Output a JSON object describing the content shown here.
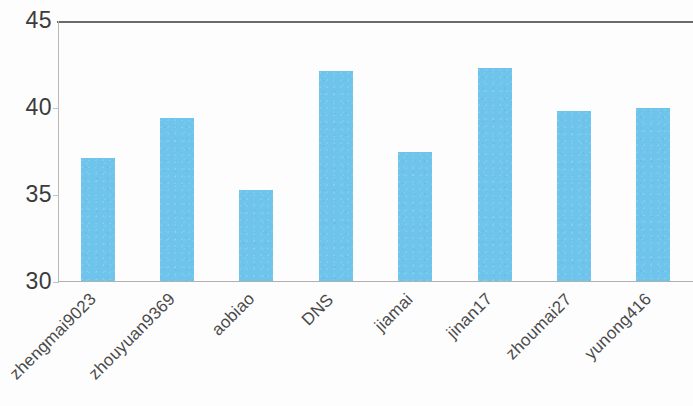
{
  "chart_data": {
    "type": "bar",
    "title": "",
    "subtitle": "",
    "xlabel": "",
    "ylabel": "",
    "categories": [
      "zhengmai9023",
      "zhouyuan9369",
      "aobiao",
      "DNS",
      "jiamai",
      "jinan17",
      "zhoumai27",
      "yunong416"
    ],
    "values": [
      37.1,
      39.4,
      35.3,
      42.1,
      37.5,
      42.3,
      39.8,
      40.0
    ],
    "ylim": [
      30,
      45
    ],
    "yticks": [
      30,
      35,
      40,
      45
    ],
    "ytick_labels": [
      "30",
      "35",
      "40",
      "45"
    ],
    "grid": false,
    "legend": false,
    "legend_position": "none",
    "bar_color": "#6FC4EC",
    "axis_color": "#B9B9B9",
    "top_border_color": "#6B6B6B",
    "tick_label_color": "#3B3B3B",
    "category_label_rotation": -45
  }
}
